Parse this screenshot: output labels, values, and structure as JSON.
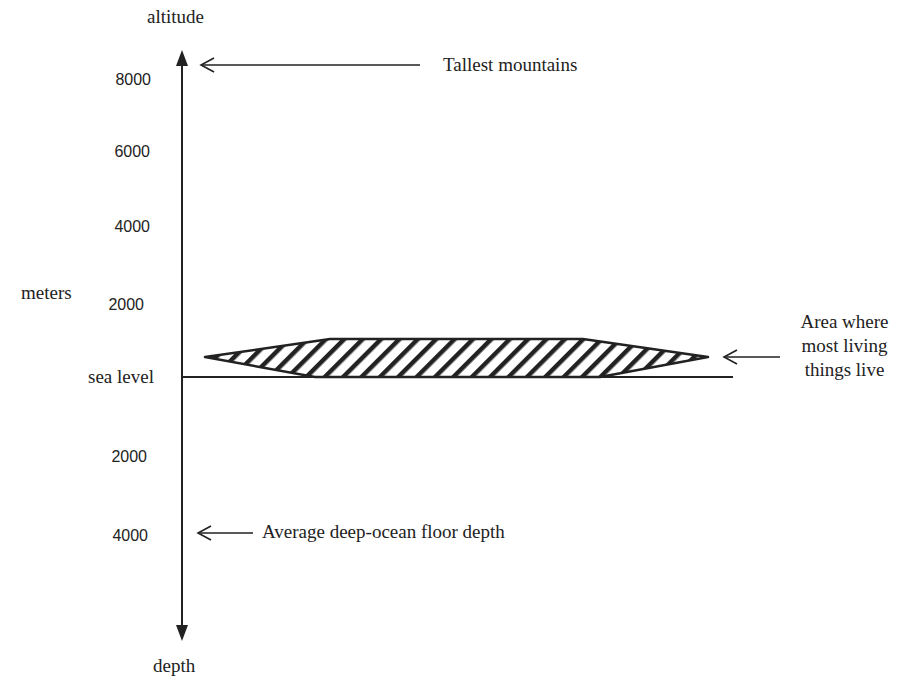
{
  "diagram": {
    "colors": {
      "ink": "#222222",
      "background": "#ffffff"
    },
    "axis": {
      "top_label": "altitude",
      "bottom_label": "depth",
      "unit_label": "meters",
      "zero_label": "sea level",
      "altitude_ticks": [
        "8000",
        "6000",
        "4000",
        "2000"
      ],
      "depth_ticks": [
        "2000",
        "4000"
      ]
    },
    "annotations": {
      "tallest_mountains": "Tallest mountains",
      "living_area_line1": "Area where",
      "living_area_line2": "most living",
      "living_area_line3": "things live",
      "ocean_floor": "Average deep-ocean floor depth"
    },
    "icons": {
      "axis_top": "arrowhead-up-icon",
      "axis_bottom": "arrowhead-down-icon",
      "pointer": "open-arrow-left-icon",
      "biosphere_band": "hatched-lens-shape"
    }
  }
}
